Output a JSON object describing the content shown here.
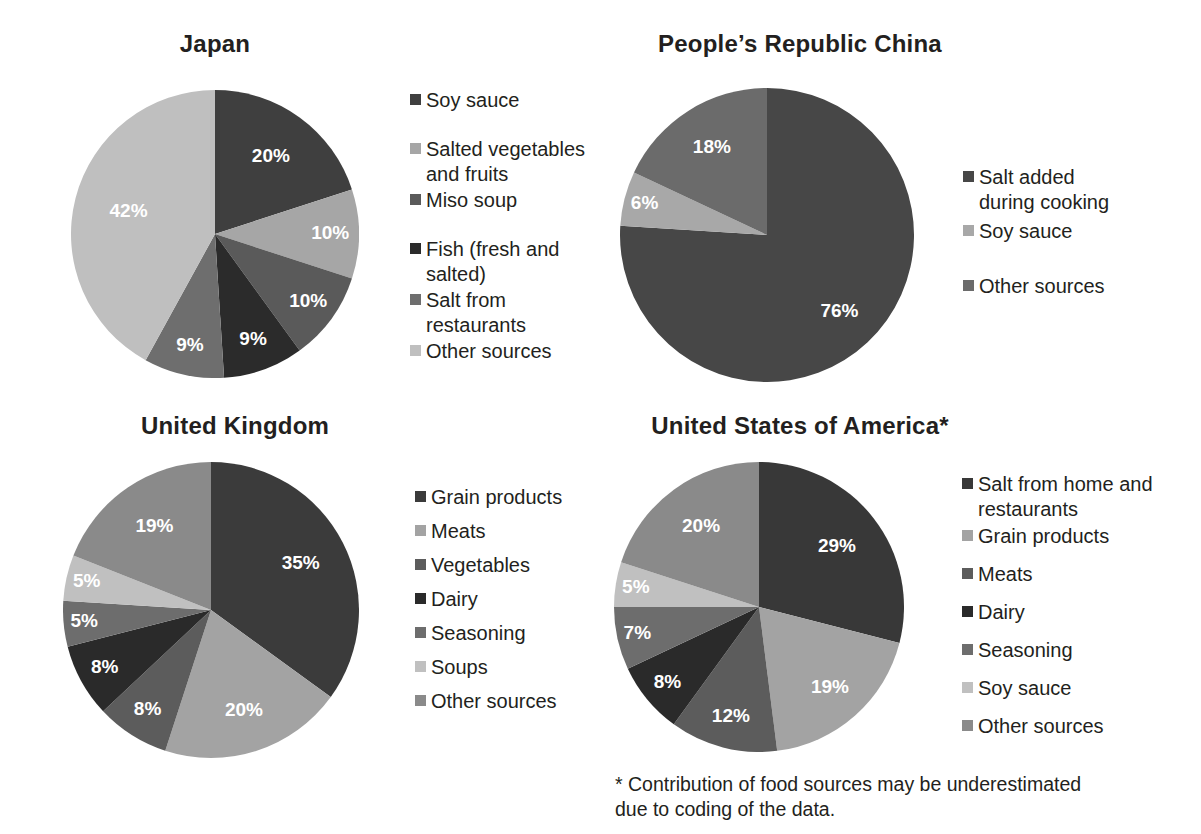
{
  "footnote": {
    "text": "* Contribution of food sources may be underestimated\ndue to coding of the data."
  },
  "chart_data": [
    {
      "type": "pie",
      "id": "japan",
      "title": "Japan",
      "start_angle": 0,
      "direction": "clockwise",
      "categories": [
        "Soy sauce",
        "Salted vegetables\nand fruits",
        "Miso soup",
        "Fish (fresh and\nsalted)",
        "Salt from\nrestaurants",
        "Other sources"
      ],
      "values": [
        20,
        10,
        10,
        9,
        9,
        42
      ],
      "labels": [
        "20%",
        "10%",
        "10%",
        "9%",
        "9%",
        "42%"
      ],
      "colors": [
        "#3f3f3f",
        "#a6a6a6",
        "#5a5a5a",
        "#2b2b2b",
        "#6e6e6e",
        "#bfbfbf"
      ],
      "legend_position": "right"
    },
    {
      "type": "pie",
      "id": "china",
      "title": "People’s Republic China",
      "start_angle": 0,
      "direction": "clockwise",
      "categories": [
        "Salt added\nduring cooking",
        "Soy sauce",
        "Other sources"
      ],
      "values": [
        76,
        6,
        18
      ],
      "labels": [
        "76%",
        "6%",
        "18%"
      ],
      "colors": [
        "#474747",
        "#a8a8a8",
        "#6b6b6b"
      ],
      "legend_position": "right"
    },
    {
      "type": "pie",
      "id": "united-kingdom",
      "title": "United Kingdom",
      "start_angle": 0,
      "direction": "clockwise",
      "categories": [
        "Grain products",
        "Meats",
        "Vegetables",
        "Dairy",
        "Seasoning",
        "Soups",
        "Other sources"
      ],
      "values": [
        35,
        20,
        8,
        8,
        5,
        5,
        19
      ],
      "labels": [
        "35%",
        "20%",
        "8%",
        "8%",
        "5%",
        "5%",
        "19%"
      ],
      "colors": [
        "#3b3b3b",
        "#a3a3a3",
        "#5c5c5c",
        "#2a2a2a",
        "#6d6d6d",
        "#c0c0c0",
        "#8a8a8a"
      ],
      "legend_position": "right"
    },
    {
      "type": "pie",
      "id": "united-states",
      "title": "United States of America*",
      "start_angle": 0,
      "direction": "clockwise",
      "categories": [
        "Salt from home and\nrestaurants",
        "Grain products",
        "Meats",
        "Dairy",
        "Seasoning",
        "Soy sauce",
        "Other sources"
      ],
      "values": [
        29,
        19,
        12,
        8,
        7,
        5,
        20
      ],
      "labels": [
        "29%",
        "19%",
        "12%",
        "8%",
        "7%",
        "5%",
        "20%"
      ],
      "colors": [
        "#383838",
        "#a3a3a3",
        "#5c5c5c",
        "#2a2a2a",
        "#6d6d6d",
        "#c0c0c0",
        "#8a8a8a"
      ],
      "legend_position": "right"
    }
  ]
}
